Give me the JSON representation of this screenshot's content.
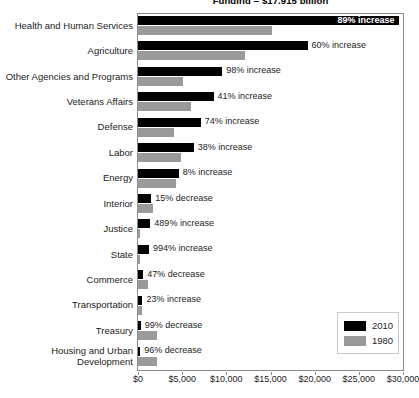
{
  "chart_data": {
    "type": "bar",
    "orientation": "horizontal",
    "title": "Funding = $17,915 billion",
    "xlabel": "",
    "ylabel": "",
    "xlim": [
      0,
      30000
    ],
    "xticks": [
      "$0",
      "$5,000",
      "$10,000",
      "$15,000",
      "$20,000",
      "$25,000",
      "$30,000"
    ],
    "xtick_values": [
      0,
      5000,
      10000,
      15000,
      20000,
      25000,
      30000
    ],
    "grid": false,
    "legend_position": "bottom-right",
    "categories": [
      "Health and Human Services",
      "Agriculture",
      "Other Agencies and Programs",
      "Veterans Affairs",
      "Defense",
      "Labor",
      "Energy",
      "Interior",
      "Justice",
      "State",
      "Commerce",
      "Transportation",
      "Treasury",
      "Housing and Urban\nDevelopment"
    ],
    "series": [
      {
        "name": "2010",
        "color": "#000000",
        "values": [
          29500,
          19200,
          9550,
          8550,
          7100,
          6300,
          4600,
          1500,
          1400,
          1250,
          600,
          500,
          300,
          250
        ]
      },
      {
        "name": "1980",
        "color": "#9a9a9a",
        "values": [
          15200,
          12100,
          5050,
          6050,
          4100,
          4850,
          4250,
          1750,
          250,
          120,
          1150,
          400,
          2100,
          2200
        ]
      }
    ],
    "data_labels": [
      "89% increase",
      "60% increase",
      "98% increase",
      "41% increase",
      "74% increase",
      "38% increase",
      "8% increase",
      "15% decrease",
      "489% increase",
      "994% increase",
      "47% decrease",
      "23% increase",
      "99% decrease",
      "96% decrease"
    ],
    "data_label_placement": [
      "inside",
      "outside",
      "outside",
      "outside",
      "outside",
      "outside",
      "outside",
      "outside",
      "outside",
      "outside",
      "outside",
      "outside",
      "outside",
      "outside"
    ],
    "legend": [
      {
        "label": "2010",
        "color": "#000000"
      },
      {
        "label": "1980",
        "color": "#9a9a9a"
      }
    ]
  }
}
